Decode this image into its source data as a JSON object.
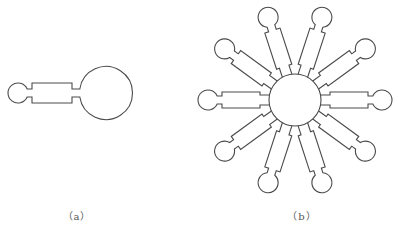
{
  "figure_a": {
    "caption": "（a）",
    "caption_pos": [
      77,
      215
    ],
    "small_circle": {
      "cx": 18,
      "cy": 93,
      "r": 10
    },
    "neck_left": {
      "x0": 27,
      "x1": 32,
      "half_width": 4
    },
    "bar": {
      "x0": 32,
      "x1": 72,
      "half_width": 10
    },
    "neck_right": {
      "x0": 72,
      "x1": 80,
      "half_width": 4
    },
    "big_circle": {
      "cx": 106,
      "cy": 93,
      "r": 26.5
    }
  },
  "figure_b": {
    "caption": "（b）",
    "caption_pos": [
      302,
      215
    ],
    "hub": {
      "cx": 295,
      "cy": 100,
      "r": 26
    },
    "spoke_count": 10,
    "spoke_angles_deg": [
      0,
      36,
      72,
      108,
      144,
      180,
      216,
      252,
      288,
      324
    ],
    "spoke": {
      "inner_neck_start": 25.5,
      "inner_neck_end": 35,
      "inner_neck_half_width": 5,
      "bar_start": 35,
      "bar_end": 73,
      "bar_half_width": 8,
      "outer_neck_end": 78,
      "outer_neck_half_width": 4,
      "tip_center": 87,
      "tip_r": 10
    }
  },
  "colors": {
    "stroke": "#4a4a4a",
    "caption": "#555555",
    "background": "#ffffff"
  }
}
